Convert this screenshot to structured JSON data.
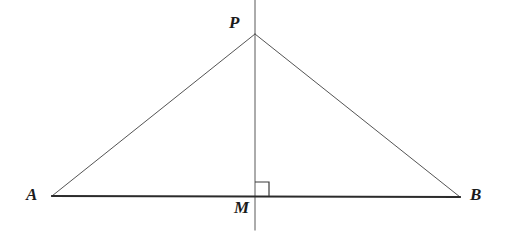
{
  "figure": {
    "background_color": "#ffffff",
    "width": 508,
    "height": 242
  },
  "style": {
    "slant_stroke_color": "#545454",
    "slant_stroke_width": 1,
    "base_stroke_color": "#2b2b2b",
    "base_stroke_width": 1.8,
    "vertical_stroke_color": "#585858",
    "vertical_stroke_width": 1,
    "right_angle_stroke_color": "#3a3a3a",
    "right_angle_stroke_width": 1.2,
    "label_color": "#1b1b1b"
  },
  "points": {
    "A": {
      "label": "A",
      "x": 52,
      "y": 196,
      "label_x": 26,
      "label_y": 186
    },
    "B": {
      "label": "B",
      "x": 460,
      "y": 197,
      "label_x": 470,
      "label_y": 186
    },
    "P": {
      "label": "P",
      "x": 255,
      "y": 34,
      "label_x": 229,
      "label_y": 14
    },
    "M": {
      "label": "M",
      "x": 255,
      "y": 196,
      "label_x": 234,
      "label_y": 199
    }
  },
  "segments": [
    {
      "name": "side-AP",
      "from": "A",
      "to": "P",
      "x1": 52,
      "y1": 196,
      "x2": 255,
      "y2": 34
    },
    {
      "name": "side-PB",
      "from": "P",
      "to": "B",
      "x1": 255,
      "y1": 34,
      "x2": 460,
      "y2": 197
    },
    {
      "name": "base-AB",
      "from": "A",
      "to": "B",
      "x1": 52,
      "y1": 196,
      "x2": 460,
      "y2": 197
    }
  ],
  "lines": [
    {
      "name": "perpendicular-bisector",
      "x1": 255,
      "y1": 0,
      "x2": 255,
      "y2": 230
    }
  ],
  "markers": {
    "right_angle": {
      "name": "right-angle-at-M",
      "at": "M",
      "size": 14,
      "x": 255,
      "y": 196,
      "orientation": "upper-right"
    }
  }
}
